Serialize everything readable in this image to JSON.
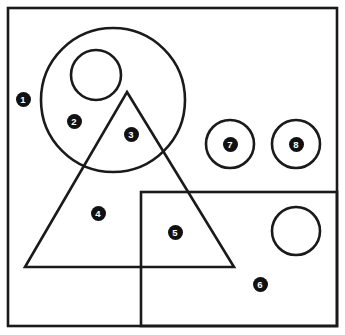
{
  "figure": {
    "width": 345,
    "height": 335,
    "background_color": "#ffffff",
    "stroke_color": "#1a1a1a",
    "label_fill_color": "#111111",
    "label_text_color": "#ffffff",
    "border": {
      "name": "outer-frame",
      "x": 8,
      "y": 8,
      "width": 329,
      "height": 318,
      "stroke_width": 2.6
    },
    "shapes": [
      {
        "id": "big-circle",
        "type": "circle",
        "cx": 113,
        "cy": 100,
        "r": 72,
        "stroke_width": 2.6
      },
      {
        "id": "small-circle-top",
        "type": "circle",
        "cx": 96,
        "cy": 75,
        "r": 25,
        "stroke_width": 2.6
      },
      {
        "id": "triangle",
        "type": "polygon",
        "points": "127,92 234,267 25,267",
        "stroke_width": 2.6
      },
      {
        "id": "rectangle",
        "type": "rect",
        "x": 141,
        "y": 192,
        "width": 196,
        "height": 134,
        "stroke_width": 2.6
      },
      {
        "id": "circle-seven",
        "type": "circle",
        "cx": 230,
        "cy": 144,
        "r": 24,
        "stroke_width": 2.6
      },
      {
        "id": "circle-eight",
        "type": "circle",
        "cx": 296,
        "cy": 144,
        "r": 24,
        "stroke_width": 2.6
      },
      {
        "id": "circle-plain-lower-right",
        "type": "circle",
        "cx": 296,
        "cy": 231,
        "r": 24,
        "stroke_width": 2.6
      }
    ],
    "labels": [
      {
        "id": "label-1",
        "text": "1",
        "x": 23,
        "y": 99,
        "region": "outside all shapes, left of big circle"
      },
      {
        "id": "label-2",
        "text": "2",
        "x": 74,
        "y": 121,
        "region": "inside big circle only"
      },
      {
        "id": "label-3",
        "text": "3",
        "x": 131,
        "y": 134,
        "region": "inside big circle and triangle"
      },
      {
        "id": "label-4",
        "text": "4",
        "x": 98,
        "y": 213,
        "region": "inside triangle only"
      },
      {
        "id": "label-5",
        "text": "5",
        "x": 175,
        "y": 232,
        "region": "inside triangle and rectangle"
      },
      {
        "id": "label-6",
        "text": "6",
        "x": 260,
        "y": 284,
        "region": "inside rectangle only"
      },
      {
        "id": "label-7",
        "text": "7",
        "x": 230,
        "y": 144,
        "region": "inside small circle seven"
      },
      {
        "id": "label-8",
        "text": "8",
        "x": 296,
        "y": 144,
        "region": "inside small circle eight"
      }
    ]
  }
}
